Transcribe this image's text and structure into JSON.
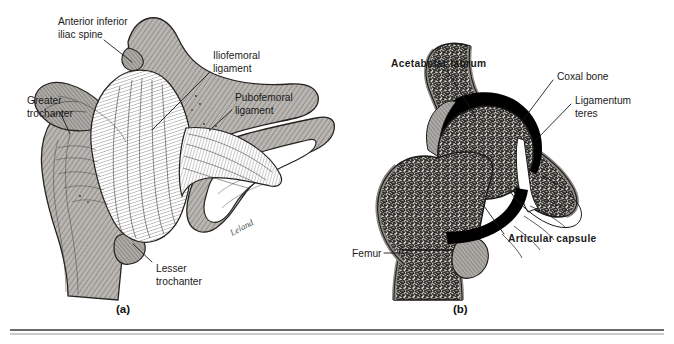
{
  "figure": {
    "title_alt": "Hip joint anatomy - anterior view and frontal section",
    "rule_color": "#3a3a3a",
    "bone_fill": "#b9b6b2",
    "ligament_fill": "#ffffff",
    "cartilage_color": "#000000",
    "ink_color": "#1a1a1a"
  },
  "panels": [
    {
      "id": "(a)",
      "name": "anterior-view-panel",
      "labels": [
        {
          "name": "anterior-inferior-iliac-spine",
          "text_line1": "Anterior inferior",
          "text_line2": "iliac spine",
          "x": 58,
          "y": 18,
          "anchor": "start"
        },
        {
          "name": "greater-trochanter",
          "text_line1": "Greater",
          "text_line2": "trochanter",
          "x": 27,
          "y": 100,
          "anchor": "start"
        },
        {
          "name": "iliofemoral-ligament",
          "text_line1": "Iliofemoral",
          "text_line2": "ligament",
          "x": 213,
          "y": 55,
          "anchor": "start"
        },
        {
          "name": "pubofemoral-ligament",
          "text_line1": "Pubofemoral",
          "text_line2": "ligament",
          "x": 235,
          "y": 97,
          "anchor": "start"
        },
        {
          "name": "lesser-trochanter",
          "text_line1": "Lesser",
          "text_line2": "trochanter",
          "x": 156,
          "y": 268,
          "anchor": "start"
        }
      ],
      "signature": "Leland",
      "panel_id_x": 116,
      "panel_id_y": 313
    },
    {
      "id": "(b)",
      "name": "frontal-section-panel",
      "labels": [
        {
          "name": "acetabular-labrum",
          "text_line1": "Acetabular labrum",
          "text_line2": "",
          "x": 391,
          "y": 63,
          "anchor": "start"
        },
        {
          "name": "coxal-bone",
          "text_line1": "Coxal bone",
          "text_line2": "",
          "x": 557,
          "y": 76,
          "anchor": "start"
        },
        {
          "name": "ligamentum-teres",
          "text_line1": "Ligamentum",
          "text_line2": "teres",
          "x": 575,
          "y": 100,
          "anchor": "start"
        },
        {
          "name": "articular-capsule",
          "text_line1": "Articular capsule",
          "text_line2": "",
          "x": 508,
          "y": 238,
          "anchor": "start"
        },
        {
          "name": "femur",
          "text_line1": "Femur",
          "text_line2": "",
          "x": 352,
          "y": 257,
          "anchor": "start"
        }
      ],
      "panel_id_x": 453,
      "panel_id_y": 313
    }
  ]
}
